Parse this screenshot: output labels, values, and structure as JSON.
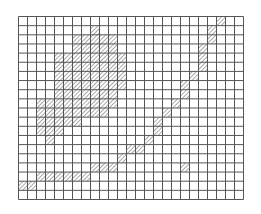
{
  "figure": {
    "type": "grid-shading",
    "grid": {
      "cols": 25,
      "rows": 20
    },
    "colors": {
      "background": "#ffffff",
      "grid_line": "#555555",
      "hatch": "#7a7a7a"
    },
    "hatched_cells": [
      [
        0,
        [
          22
        ]
      ],
      [
        1,
        [
          8,
          21
        ]
      ],
      [
        2,
        [
          6,
          7,
          8,
          9,
          10,
          21
        ]
      ],
      [
        3,
        [
          6,
          7,
          8,
          9,
          10,
          20
        ]
      ],
      [
        4,
        [
          4,
          5,
          6,
          7,
          8,
          9,
          10,
          11,
          20
        ]
      ],
      [
        5,
        [
          4,
          5,
          6,
          7,
          8,
          9,
          10,
          11,
          20
        ]
      ],
      [
        6,
        [
          4,
          5,
          6,
          7,
          8,
          9,
          10,
          11,
          19
        ]
      ],
      [
        7,
        [
          4,
          5,
          6,
          7,
          8,
          9,
          10,
          11,
          18
        ]
      ],
      [
        8,
        [
          4,
          5,
          6,
          7,
          8,
          9,
          10,
          18
        ]
      ],
      [
        9,
        [
          2,
          3,
          4,
          5,
          6,
          7,
          8,
          9,
          10,
          17
        ]
      ],
      [
        10,
        [
          2,
          3,
          4,
          5,
          6,
          7,
          8,
          9,
          16
        ]
      ],
      [
        11,
        [
          2,
          3,
          4,
          5,
          6,
          15
        ]
      ],
      [
        12,
        [
          2,
          3,
          4,
          15
        ]
      ],
      [
        13,
        [
          3,
          14
        ]
      ],
      [
        14,
        [
          12,
          13
        ]
      ],
      [
        15,
        [
          11
        ]
      ],
      [
        16,
        [
          8,
          9,
          10,
          18
        ]
      ],
      [
        17,
        [
          2,
          3,
          4,
          5,
          6,
          7
        ]
      ],
      [
        18,
        [
          0,
          1
        ]
      ],
      [
        19,
        []
      ]
    ]
  }
}
